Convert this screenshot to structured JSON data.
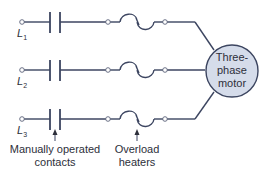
{
  "diagram": {
    "lines": [
      {
        "label": "L",
        "subscript": "1"
      },
      {
        "label": "L",
        "subscript": "2"
      },
      {
        "label": "L",
        "subscript": "3"
      }
    ],
    "motor": {
      "line1": "Three-",
      "line2": "phase",
      "line3": "motor",
      "fill": "#d5dcea"
    },
    "annotations": {
      "contacts": {
        "line1": "Manually operated",
        "line2": "contacts"
      },
      "heaters": {
        "line1": "Overload",
        "line2": "heaters"
      }
    },
    "colors": {
      "wire": "#3c4560",
      "text": "#2d2f3a"
    }
  }
}
